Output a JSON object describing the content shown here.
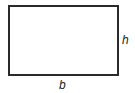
{
  "diagram": {
    "shape": "rectangle",
    "labels": {
      "height": "h",
      "base": "b"
    },
    "stroke_color": "#2a2a2a"
  }
}
